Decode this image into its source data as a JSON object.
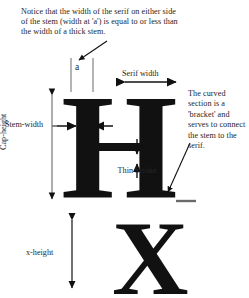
{
  "diagram": {
    "background_color": "#ffffff",
    "ink_color": "#111111",
    "text_color": "#262626"
  },
  "notes": {
    "top": "Notice that the width of the serif on either side of the stem (width at 'a') is equal to or less than the width of a thick stem.",
    "right": "The curved section is a 'bracket' and serves to connect the stem to the serif."
  },
  "labels": {
    "serif_width": "Serif width",
    "stem_width": "Stem-width",
    "cap_height": "Cap-height",
    "thin_stroke": "Thin Stroke",
    "x_height": "x-height",
    "a_measure": "a"
  },
  "glyphs": {
    "capital_h": "H",
    "lowercase_x": "X"
  }
}
